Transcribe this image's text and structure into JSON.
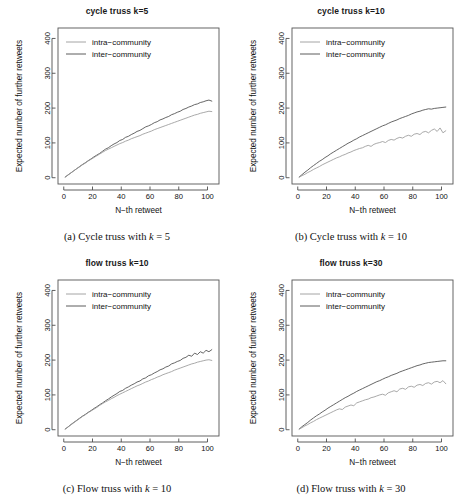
{
  "figure": {
    "panel_count": 4,
    "series_colors": {
      "intra_community": "#9a9a9a",
      "inter_community": "#4a4a4a"
    },
    "axis_color": "#4d4d4d",
    "background": "#ffffff"
  },
  "axes": {
    "xlabel": "N−th retweet",
    "ylabel": "Expected number of further retweets",
    "xticks": [
      0,
      20,
      40,
      60,
      80,
      100
    ],
    "yticks": [
      0,
      100,
      200,
      300,
      400
    ],
    "xlim": [
      -4,
      108
    ],
    "ylim": [
      -18,
      430
    ]
  },
  "legend": {
    "entries": [
      {
        "label": "intra−community",
        "key": "intra"
      },
      {
        "label": "inter−community",
        "key": "inter"
      }
    ]
  },
  "panels": [
    {
      "id": "a",
      "title": "cycle truss k=5",
      "caption_prefix": "(a) Cycle truss with",
      "caption_var": "k",
      "caption_eq": "= 5"
    },
    {
      "id": "b",
      "title": "cycle truss k=10",
      "caption_prefix": "(b) Cycle truss with",
      "caption_var": "k",
      "caption_eq": "= 10"
    },
    {
      "id": "c",
      "title": "flow truss k=10",
      "caption_prefix": "(c) Flow truss with",
      "caption_var": "k",
      "caption_eq": "= 10"
    },
    {
      "id": "d",
      "title": "flow truss k=30",
      "caption_prefix": "(d) Flow truss with",
      "caption_var": "k",
      "caption_eq": "= 30"
    }
  ],
  "chart_data": [
    {
      "type": "line",
      "panel": "a",
      "title": "cycle truss k=5",
      "xlabel": "N−th retweet",
      "ylabel": "Expected number of further retweets",
      "xlim": [
        0,
        104
      ],
      "ylim": [
        0,
        400
      ],
      "xticks": [
        0,
        20,
        40,
        60,
        80,
        100
      ],
      "yticks": [
        0,
        100,
        200,
        300,
        400
      ],
      "grid": false,
      "legend_position": "top-left",
      "x": [
        1,
        3,
        5,
        7,
        9,
        11,
        13,
        15,
        17,
        19,
        21,
        23,
        25,
        27,
        29,
        31,
        33,
        35,
        37,
        39,
        41,
        43,
        45,
        47,
        49,
        51,
        53,
        55,
        57,
        59,
        61,
        63,
        65,
        67,
        69,
        71,
        73,
        75,
        77,
        79,
        81,
        83,
        85,
        87,
        89,
        91,
        93,
        95,
        97,
        99,
        101,
        103
      ],
      "series": [
        {
          "name": "inter−community",
          "color": "#4a4a4a",
          "values": [
            2,
            8,
            14,
            20,
            26,
            32,
            38,
            43,
            49,
            54,
            60,
            65,
            70,
            76,
            82,
            86,
            92,
            97,
            101,
            107,
            110,
            116,
            119,
            124,
            128,
            133,
            136,
            141,
            146,
            149,
            153,
            158,
            161,
            166,
            169,
            173,
            176,
            181,
            184,
            188,
            191,
            196,
            199,
            203,
            206,
            210,
            212,
            216,
            218,
            221,
            223,
            220
          ]
        },
        {
          "name": "intra−community",
          "color": "#9a9a9a",
          "values": [
            2,
            8,
            14,
            20,
            26,
            31,
            37,
            42,
            48,
            53,
            58,
            63,
            68,
            73,
            78,
            82,
            86,
            90,
            94,
            98,
            101,
            105,
            108,
            112,
            115,
            118,
            121,
            125,
            128,
            131,
            134,
            138,
            141,
            144,
            147,
            150,
            153,
            156,
            159,
            162,
            165,
            168,
            171,
            174,
            177,
            180,
            182,
            185,
            187,
            189,
            191,
            190
          ]
        }
      ]
    },
    {
      "type": "line",
      "panel": "b",
      "title": "cycle truss k=10",
      "xlabel": "N−th retweet",
      "ylabel": "Expected number of further retweets",
      "xlim": [
        0,
        104
      ],
      "ylim": [
        0,
        400
      ],
      "xticks": [
        0,
        20,
        40,
        60,
        80,
        100
      ],
      "yticks": [
        0,
        100,
        200,
        300,
        400
      ],
      "grid": false,
      "legend_position": "top-left",
      "x": [
        1,
        3,
        5,
        7,
        9,
        11,
        13,
        15,
        17,
        19,
        21,
        23,
        25,
        27,
        29,
        31,
        33,
        35,
        37,
        39,
        41,
        43,
        45,
        47,
        49,
        51,
        53,
        55,
        57,
        59,
        61,
        63,
        65,
        67,
        69,
        71,
        73,
        75,
        77,
        79,
        81,
        83,
        85,
        87,
        89,
        91,
        93,
        95,
        97,
        99,
        101,
        103
      ],
      "series": [
        {
          "name": "inter−community",
          "color": "#4a4a4a",
          "values": [
            2,
            9,
            16,
            22,
            29,
            35,
            41,
            47,
            52,
            58,
            63,
            69,
            74,
            79,
            84,
            89,
            94,
            99,
            103,
            108,
            112,
            117,
            121,
            125,
            129,
            133,
            137,
            141,
            145,
            149,
            152,
            156,
            160,
            163,
            166,
            170,
            173,
            176,
            179,
            183,
            186,
            189,
            191,
            194,
            196,
            198,
            197,
            199,
            200,
            201,
            202,
            203
          ]
        },
        {
          "name": "intra−community",
          "color": "#9a9a9a",
          "values": [
            2,
            6,
            10,
            15,
            19,
            24,
            28,
            32,
            37,
            41,
            45,
            49,
            53,
            57,
            60,
            64,
            67,
            71,
            74,
            78,
            81,
            84,
            86,
            90,
            93,
            90,
            96,
            99,
            101,
            104,
            101,
            107,
            110,
            108,
            113,
            116,
            114,
            119,
            122,
            119,
            125,
            127,
            124,
            131,
            133,
            129,
            136,
            140,
            133,
            143,
            129,
            135
          ]
        }
      ]
    },
    {
      "type": "line",
      "panel": "c",
      "title": "flow truss k=10",
      "xlabel": "N−th retweet",
      "ylabel": "Expected number of further retweets",
      "xlim": [
        0,
        104
      ],
      "ylim": [
        0,
        400
      ],
      "xticks": [
        0,
        20,
        40,
        60,
        80,
        100
      ],
      "yticks": [
        0,
        100,
        200,
        300,
        400
      ],
      "grid": false,
      "legend_position": "top-left",
      "x": [
        1,
        3,
        5,
        7,
        9,
        11,
        13,
        15,
        17,
        19,
        21,
        23,
        25,
        27,
        29,
        31,
        33,
        35,
        37,
        39,
        41,
        43,
        45,
        47,
        49,
        51,
        53,
        55,
        57,
        59,
        61,
        63,
        65,
        67,
        69,
        71,
        73,
        75,
        77,
        79,
        81,
        83,
        85,
        87,
        89,
        91,
        93,
        95,
        97,
        99,
        101,
        103
      ],
      "series": [
        {
          "name": "inter−community",
          "color": "#4a4a4a",
          "values": [
            2,
            8,
            15,
            21,
            27,
            33,
            39,
            44,
            50,
            55,
            61,
            66,
            72,
            77,
            83,
            88,
            94,
            99,
            104,
            110,
            113,
            119,
            123,
            128,
            132,
            137,
            140,
            146,
            149,
            155,
            158,
            163,
            167,
            172,
            175,
            180,
            183,
            189,
            192,
            196,
            199,
            205,
            208,
            214,
            211,
            220,
            216,
            224,
            220,
            228,
            224,
            230
          ]
        },
        {
          "name": "intra−community",
          "color": "#9a9a9a",
          "values": [
            2,
            8,
            14,
            20,
            26,
            32,
            38,
            43,
            49,
            54,
            59,
            64,
            70,
            75,
            80,
            84,
            89,
            93,
            98,
            102,
            106,
            110,
            114,
            118,
            122,
            126,
            129,
            133,
            137,
            140,
            144,
            147,
            151,
            154,
            158,
            161,
            164,
            167,
            171,
            174,
            177,
            180,
            183,
            186,
            189,
            191,
            194,
            196,
            198,
            200,
            201,
            199
          ]
        }
      ]
    },
    {
      "type": "line",
      "panel": "d",
      "title": "flow truss k=30",
      "xlabel": "N−th retweet",
      "ylabel": "Expected number of further retweets",
      "xlim": [
        0,
        104
      ],
      "ylim": [
        0,
        400
      ],
      "xticks": [
        0,
        20,
        40,
        60,
        80,
        100
      ],
      "yticks": [
        0,
        100,
        200,
        300,
        400
      ],
      "grid": false,
      "legend_position": "top-left",
      "x": [
        1,
        3,
        5,
        7,
        9,
        11,
        13,
        15,
        17,
        19,
        21,
        23,
        25,
        27,
        29,
        31,
        33,
        35,
        37,
        39,
        41,
        43,
        45,
        47,
        49,
        51,
        53,
        55,
        57,
        59,
        61,
        63,
        65,
        67,
        69,
        71,
        73,
        75,
        77,
        79,
        81,
        83,
        85,
        87,
        89,
        91,
        93,
        95,
        97,
        99,
        101,
        103
      ],
      "series": [
        {
          "name": "inter−community",
          "color": "#4a4a4a",
          "values": [
            2,
            9,
            15,
            21,
            28,
            34,
            40,
            45,
            51,
            56,
            62,
            67,
            72,
            77,
            82,
            87,
            92,
            96,
            101,
            105,
            110,
            114,
            118,
            122,
            126,
            130,
            134,
            138,
            141,
            145,
            149,
            152,
            156,
            159,
            162,
            166,
            169,
            172,
            175,
            178,
            181,
            184,
            186,
            189,
            191,
            193,
            194,
            195,
            196,
            197,
            198,
            198
          ]
        },
        {
          "name": "intra−community",
          "color": "#9a9a9a",
          "values": [
            2,
            6,
            11,
            15,
            20,
            24,
            29,
            33,
            37,
            41,
            45,
            49,
            53,
            57,
            60,
            58,
            65,
            68,
            71,
            69,
            77,
            80,
            83,
            86,
            88,
            92,
            94,
            97,
            100,
            102,
            99,
            106,
            109,
            112,
            109,
            117,
            119,
            116,
            123,
            125,
            122,
            128,
            130,
            127,
            133,
            135,
            131,
            137,
            139,
            135,
            141,
            132
          ]
        }
      ]
    }
  ]
}
